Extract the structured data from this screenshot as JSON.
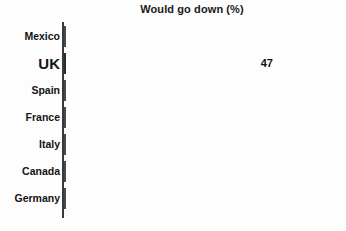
{
  "chart_data": {
    "type": "bar",
    "orientation": "horizontal",
    "title": "Would go down (%)",
    "xlabel": "",
    "ylabel": "",
    "categories": [
      "Mexico",
      "UK",
      "Spain",
      "France",
      "Italy",
      "Canada",
      "Germany"
    ],
    "values": [
      60,
      47,
      38,
      37,
      36,
      34,
      22
    ],
    "value_labels": [
      "60",
      "47",
      "38",
      "37",
      "36",
      "34",
      "22"
    ],
    "xlim": [
      0,
      60
    ],
    "grid": false,
    "legend": false,
    "highlight_category": "UK",
    "series": [
      {
        "name": "Would go down (%)",
        "values": [
          60,
          47,
          38,
          37,
          36,
          34,
          22
        ]
      }
    ],
    "bars": [
      {
        "category": "Mexico",
        "value": 60,
        "label": "60",
        "style": "filled",
        "label_style": "normal",
        "value_color": "#ffffff"
      },
      {
        "category": "UK",
        "value": 47,
        "label": "47",
        "style": "hollow",
        "label_style": "big",
        "value_color": "#111111"
      },
      {
        "category": "Spain",
        "value": 38,
        "label": "38",
        "style": "filled",
        "label_style": "normal",
        "value_color": "#ffffff"
      },
      {
        "category": "France",
        "value": 37,
        "label": "37",
        "style": "filled",
        "label_style": "normal",
        "value_color": "#ffffff"
      },
      {
        "category": "Italy",
        "value": 36,
        "label": "36",
        "style": "filled",
        "label_style": "normal",
        "value_color": "#ffffff"
      },
      {
        "category": "Canada",
        "value": 34,
        "label": "34",
        "style": "filled",
        "label_style": "normal",
        "value_color": "#ffffff"
      },
      {
        "category": "Germany",
        "value": 22,
        "label": "22",
        "style": "filled",
        "label_style": "normal",
        "value_color": "#ffffff"
      }
    ],
    "colors": {
      "bar_fill": "#9a9a9a",
      "bar_stroke": "#4a4a4a",
      "highlight_fill": "#ffffff",
      "highlight_stroke": "#2c2c2c",
      "axis": "#3a3a3a",
      "text": "#141414",
      "background": "#fdfdfd"
    }
  }
}
